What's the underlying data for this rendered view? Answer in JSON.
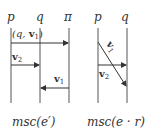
{
  "diagrams": [
    {
      "caption": "msc(e′)",
      "processes": [
        "p",
        "q",
        "π"
      ],
      "messages": [
        {
          "from": "p",
          "to": "π",
          "label_prefix": "(q, ",
          "label_vec": "v",
          "label_sub": "1",
          "label_suffix": ")"
        },
        {
          "from": "p",
          "to": "q",
          "label_vec": "v",
          "label_sub": "2"
        },
        {
          "from": "π",
          "to": "q",
          "label_vec": "v",
          "label_sub": "1"
        }
      ]
    },
    {
      "caption": "msc(e · r)",
      "processes": [
        "p",
        "q"
      ],
      "messages": [
        {
          "from": "p",
          "to": "q",
          "label_vec": "v",
          "label_sub": "1",
          "diagonal": true
        },
        {
          "from": "p",
          "to": "q",
          "label_vec": "v",
          "label_sub": "2"
        }
      ]
    }
  ]
}
